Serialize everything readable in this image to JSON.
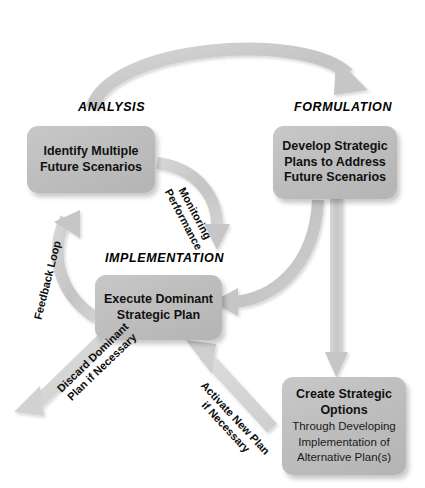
{
  "diagram": {
    "background_color": "#ffffff",
    "box_fill_color": "#bebebe",
    "arrow_color": "#c9c9c9",
    "text_color": "#111111"
  },
  "phases": [
    {
      "id": "analysis",
      "label": "ANALYSIS"
    },
    {
      "id": "formulation",
      "label": "FORMULATION"
    },
    {
      "id": "implementation",
      "label": "IMPLEMENTATION"
    }
  ],
  "nodes": [
    {
      "id": "identify-scenarios",
      "title_line1": "Identify Multiple",
      "title_line2": "Future Scenarios",
      "subtitle": ""
    },
    {
      "id": "develop-plans",
      "title_line1": "Develop Strategic",
      "title_line2": "Plans to Address",
      "title_line3": "Future Scenarios",
      "subtitle": ""
    },
    {
      "id": "execute-plan",
      "title_line1": "Execute Dominant",
      "title_line2": "Strategic Plan",
      "subtitle": ""
    },
    {
      "id": "create-options",
      "title_line1": "Create Strategic",
      "title_line2": "Options",
      "sub_line1": "Through Developing",
      "sub_line2": "Implementation of",
      "sub_line3": "Alternative Plan(s)"
    }
  ],
  "connectors": [
    {
      "id": "analysis-to-formulation",
      "label": "",
      "from": "identify-scenarios",
      "to": "develop-plans",
      "shape": "arc-over-top"
    },
    {
      "id": "monitoring-performance",
      "label_line1": "Monitoring",
      "label_line2": "Performance",
      "from": "identify-scenarios",
      "to": "execute-plan",
      "shape": "arc-down-right"
    },
    {
      "id": "formulation-to-options",
      "label": "",
      "from": "develop-plans",
      "to": "create-options",
      "shape": "straight-down"
    },
    {
      "id": "formulation-to-execute",
      "label": "",
      "from": "develop-plans",
      "to": "execute-plan",
      "shape": "arc-down-left"
    },
    {
      "id": "feedback-loop",
      "label_line1": "Feedback Loop",
      "from": "execute-plan",
      "to": "identify-scenarios",
      "shape": "arc-up-left"
    },
    {
      "id": "discard-dominant-plan",
      "label_line1": "Discard Dominant",
      "label_line2": "Plan if Necessary",
      "from": "execute-plan",
      "to": "",
      "shape": "diagonal-down-left"
    },
    {
      "id": "activate-new-plan",
      "label_line1": "Activate New Plan",
      "label_line2": "if Necessary",
      "from": "create-options",
      "to": "execute-plan",
      "shape": "diagonal-up-left"
    }
  ]
}
